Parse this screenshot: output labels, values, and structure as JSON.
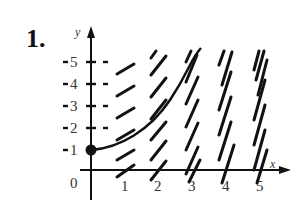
{
  "problem": {
    "number": "1."
  },
  "axes": {
    "x_label": "x",
    "y_label": "y",
    "origin_label": "0",
    "x_ticks": [
      "1",
      "2",
      "3",
      "4",
      "5"
    ],
    "y_ticks": [
      "1",
      "2",
      "3",
      "4",
      "5"
    ]
  },
  "figure": {
    "type": "slope-field",
    "initial_point": {
      "x": 0,
      "y": 1
    },
    "stroke_color": "#111111"
  }
}
